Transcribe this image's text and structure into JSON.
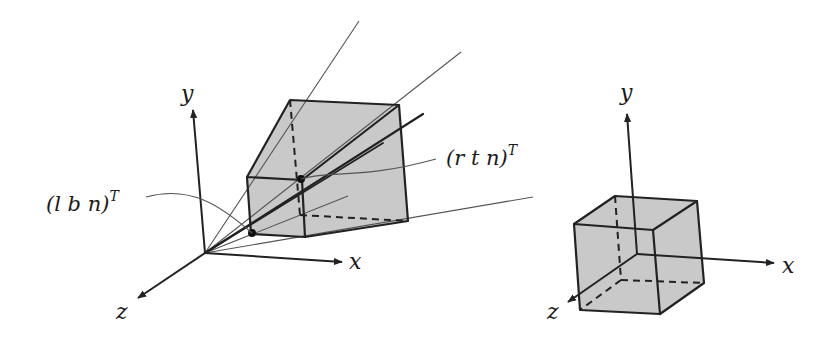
{
  "left_diagram": {
    "title": "view frustum",
    "axis_labels": {
      "x": "x",
      "y": "y",
      "z": "z"
    },
    "annotations": {
      "near_bottom_left": {
        "base": "(l b n)",
        "sup": "T"
      },
      "near_top_right": {
        "base": "(r t n)",
        "sup": "T"
      }
    }
  },
  "right_diagram": {
    "title": "canonical view volume",
    "axis_labels": {
      "x": "x",
      "y": "y",
      "z": "z"
    }
  },
  "colors": {
    "stroke": "#222222",
    "fill": "#c9c9c9",
    "ray": "#555555",
    "background": "#ffffff"
  }
}
